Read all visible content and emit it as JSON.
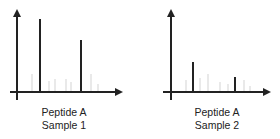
{
  "chart_data": [
    {
      "type": "bar",
      "title": "Peptide A Sample 1",
      "label_line1": "Peptide A",
      "label_line2": "Sample 1",
      "xlabel": "",
      "ylabel": "",
      "grid": false,
      "ticks": "none",
      "axis_color": "#222222",
      "main_peaks": [
        {
          "x": 40,
          "height": 73
        },
        {
          "x": 81,
          "height": 52
        }
      ],
      "background_peaks": [
        {
          "x": 32,
          "height": 18
        },
        {
          "x": 49,
          "height": 11
        },
        {
          "x": 55,
          "height": 13
        },
        {
          "x": 66,
          "height": 13
        },
        {
          "x": 71,
          "height": 10
        },
        {
          "x": 91,
          "height": 18
        },
        {
          "x": 98,
          "height": 8
        }
      ],
      "background_peak_color": "#e4e4e4"
    },
    {
      "type": "bar",
      "title": "Peptide A Sample 2",
      "label_line1": "Peptide A",
      "label_line2": "Sample 2",
      "xlabel": "",
      "ylabel": "",
      "grid": false,
      "ticks": "none",
      "axis_color": "#222222",
      "main_peaks": [
        {
          "x": 193,
          "height": 30
        },
        {
          "x": 235,
          "height": 15
        }
      ],
      "background_peaks": [
        {
          "x": 186,
          "height": 12
        },
        {
          "x": 200,
          "height": 14
        },
        {
          "x": 208,
          "height": 18
        },
        {
          "x": 220,
          "height": 10
        },
        {
          "x": 228,
          "height": 8
        },
        {
          "x": 244,
          "height": 12
        },
        {
          "x": 250,
          "height": 6
        }
      ],
      "background_peak_color": "#e4e4e4"
    }
  ]
}
